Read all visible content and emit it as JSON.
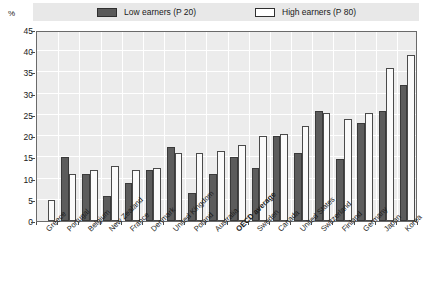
{
  "axis": {
    "unit_label": "%",
    "y_ticks": [
      0,
      5,
      10,
      15,
      20,
      25,
      30,
      35,
      40,
      45
    ],
    "y_min": 0,
    "y_max": 45
  },
  "legend": {
    "low": {
      "label": "Low earners (P 20)",
      "swatch": "filled-dark-square-icon",
      "color": "#5c5c5c"
    },
    "high": {
      "label": "High earners (P 80)",
      "swatch": "outlined-white-square-icon",
      "color": "#ffffff"
    }
  },
  "chart_data": {
    "type": "bar",
    "title": "",
    "subtitle": "",
    "xlabel": "",
    "ylabel": "%",
    "ylim": [
      0,
      45
    ],
    "grid": true,
    "legend_position": "top",
    "categories": [
      "Greece",
      "Portugal",
      "Belgium",
      "New Zealand",
      "France",
      "Denmark",
      "United Kingdom",
      "Poland",
      "Australia",
      "OECD average",
      "Sweden",
      "Canada",
      "United States",
      "Switzerland",
      "Finland",
      "Germany",
      "Japan",
      "Korea"
    ],
    "emphasized_category": "OECD average",
    "series": [
      {
        "name": "Low earners (P 20)",
        "color": "#5c5c5c",
        "values": [
          0,
          15,
          11,
          6,
          9,
          12,
          17.5,
          6.5,
          11,
          15,
          12.5,
          20,
          16,
          26,
          14.5,
          23,
          26,
          32
        ]
      },
      {
        "name": "High earners (P 80)",
        "color": "#ffffff",
        "values": [
          5,
          11,
          12,
          13,
          12,
          12.5,
          16,
          16,
          16.5,
          18,
          20,
          20.5,
          22.5,
          25.5,
          24,
          25.5,
          36,
          39
        ]
      }
    ]
  }
}
